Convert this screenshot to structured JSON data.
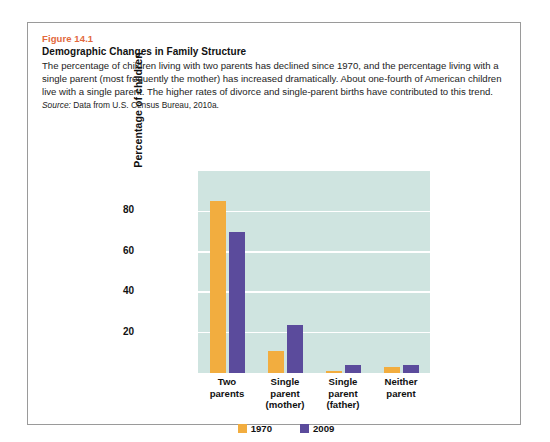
{
  "figure": {
    "number": "Figure 14.1",
    "title": "Demographic Changes in Family Structure",
    "description": "The percentage of children living with two parents has declined since 1970, and the percentage living with a single parent (most frequently the mother) has increased dramatically. About one-fourth of American children live with a single parent. The higher rates of divorce and single-parent births have contributed to this trend.",
    "source_label": "Source:",
    "source_text": " Data from U.S. Census Bureau, 2010a."
  },
  "colors": {
    "figure_number": "#e2683c",
    "plot_background": "#cfe4e0",
    "gridline": "#ffffff",
    "series_1970": "#f2ad3f",
    "series_2009": "#5b4b9c",
    "box_border": "#9a9a9a"
  },
  "chart_data": {
    "type": "bar",
    "title": "",
    "xlabel": "",
    "ylabel": "Percentage of children",
    "ylim": [
      0,
      100
    ],
    "yticks": [
      20,
      40,
      60,
      80
    ],
    "ytick_labels": [
      "20",
      "40",
      "60",
      "80"
    ],
    "grid": true,
    "legend_position": "bottom",
    "categories": [
      "Two parents",
      "Single parent (mother)",
      "Single parent (father)",
      "Neither parent"
    ],
    "category_lines": [
      [
        "Two",
        "parents"
      ],
      [
        "Single",
        "parent",
        "(mother)"
      ],
      [
        "Single",
        "parent",
        "(father)"
      ],
      [
        "Neither",
        "parent"
      ]
    ],
    "series": [
      {
        "name": "1970",
        "color": "#f2ad3f",
        "values": [
          85,
          11,
          1,
          3
        ]
      },
      {
        "name": "2009",
        "color": "#5b4b9c",
        "values": [
          70,
          24,
          4,
          4
        ]
      }
    ]
  }
}
